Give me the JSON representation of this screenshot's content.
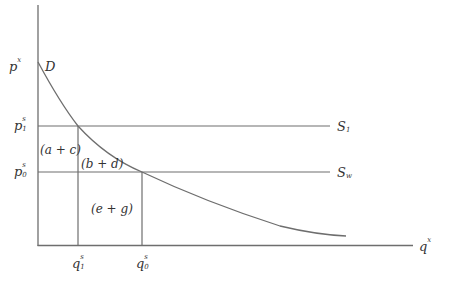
{
  "diagram": {
    "type": "supply-demand",
    "axes": {
      "y_label": {
        "base": "p",
        "sup": "x"
      },
      "x_label": {
        "base": "q",
        "sup": "x"
      }
    },
    "curves": {
      "demand_label": "D",
      "supply_1_label": {
        "base": "S",
        "sub": "1"
      },
      "supply_0_label": {
        "base": "S",
        "sub": "w"
      }
    },
    "price_labels": {
      "p1": {
        "base": "p",
        "sup": "s",
        "sub": "1"
      },
      "p0": {
        "base": "p",
        "sup": "s",
        "sub": "0"
      }
    },
    "quantity_labels": {
      "q1": {
        "base": "q",
        "sup": "s",
        "sub": "1"
      },
      "q0": {
        "base": "q",
        "sup": "s",
        "sub": "0"
      }
    },
    "regions": {
      "ac": "(a + c)",
      "bd": "(b + d)",
      "eg": "(e + g)"
    },
    "colors": {
      "line": "#6e6e6e",
      "text": "#333333"
    }
  }
}
